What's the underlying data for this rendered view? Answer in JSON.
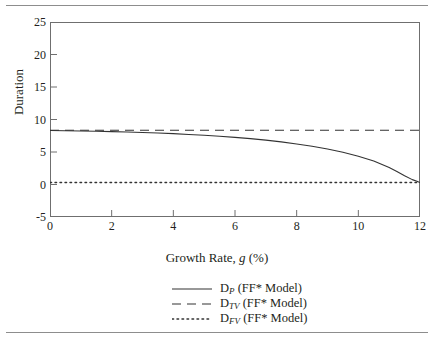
{
  "chart_data": {
    "type": "line",
    "title": "",
    "xlabel": "Growth Rate, g (%)",
    "xlabel_plain": "Growth Rate, ",
    "xlabel_var": "g",
    "xlabel_unit": " (%)",
    "ylabel": "Duration",
    "xlim": [
      0,
      12
    ],
    "ylim": [
      -5,
      25
    ],
    "xticks": [
      0,
      2,
      4,
      6,
      8,
      10,
      12
    ],
    "yticks": [
      -5,
      0,
      5,
      10,
      15,
      20,
      25
    ],
    "xtick_labels": [
      "0",
      "2",
      "4",
      "6",
      "8",
      "10",
      "12"
    ],
    "ytick_labels": [
      "-5",
      "0",
      "5",
      "10",
      "15",
      "20",
      "25"
    ],
    "grid": false,
    "legend_position": "below",
    "series": [
      {
        "name": "D_P (FF* Model)",
        "symbol": "D",
        "subscript": "P",
        "suffix": " (FF* Model)",
        "style": "solid",
        "color": "#333333",
        "x": [
          0,
          0.5,
          1,
          1.5,
          2,
          2.5,
          3,
          3.5,
          4,
          4.5,
          5,
          5.5,
          6,
          6.5,
          7,
          7.5,
          8,
          8.5,
          9,
          9.5,
          10,
          10.5,
          11,
          11.25,
          11.5,
          11.75,
          11.9,
          12
        ],
        "values": [
          8.3,
          8.27,
          8.23,
          8.19,
          8.14,
          8.08,
          8.0,
          7.92,
          7.82,
          7.7,
          7.57,
          7.42,
          7.25,
          7.05,
          6.82,
          6.55,
          6.24,
          5.88,
          5.45,
          4.95,
          4.35,
          3.6,
          2.6,
          2.0,
          1.35,
          0.75,
          0.5,
          0.3
        ]
      },
      {
        "name": "D_TV (FF* Model)",
        "symbol": "D",
        "subscript": "TV",
        "suffix": " (FF* Model)",
        "style": "dashed",
        "color": "#333333",
        "x": [
          0,
          12
        ],
        "values": [
          8.35,
          8.35
        ]
      },
      {
        "name": "D_FV (FF* Model)",
        "symbol": "D",
        "subscript": "FV",
        "suffix": " (FF* Model)",
        "style": "dotted",
        "color": "#333333",
        "x": [
          0,
          12
        ],
        "values": [
          0.3,
          0.3
        ]
      }
    ]
  },
  "axes": {
    "y_title": "Duration"
  }
}
